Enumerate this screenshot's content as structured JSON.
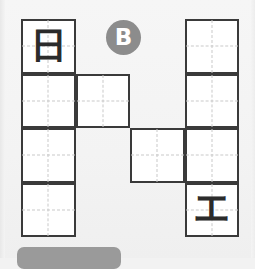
{
  "canvas": {
    "width": 255,
    "height": 258,
    "background": "#f4f4f4"
  },
  "badge": {
    "label": "B",
    "shape": "circle",
    "fill_color": "#8c8c8c",
    "text_color": "#ffffff",
    "x": 106,
    "y": 20,
    "diameter": 35
  },
  "grid": {
    "columns": 4,
    "rows": 4,
    "cell_size": 54.5,
    "origin_x": 21,
    "origin_y": 19,
    "stroke_color": "#3a3a3a",
    "cell_fill": "#ffffff",
    "guide_color": "#c9c9c9",
    "guide_style": "dashed"
  },
  "cells": [
    {
      "row": 1,
      "col": 1,
      "glyph": "日",
      "glyph_name": "kanji-sun-day"
    },
    {
      "row": 1,
      "col": 4,
      "glyph": "",
      "glyph_name": ""
    },
    {
      "row": 2,
      "col": 1,
      "glyph": "",
      "glyph_name": ""
    },
    {
      "row": 2,
      "col": 2,
      "glyph": "",
      "glyph_name": ""
    },
    {
      "row": 2,
      "col": 4,
      "glyph": "",
      "glyph_name": ""
    },
    {
      "row": 3,
      "col": 1,
      "glyph": "",
      "glyph_name": ""
    },
    {
      "row": 3,
      "col": 3,
      "glyph": "",
      "glyph_name": ""
    },
    {
      "row": 3,
      "col": 4,
      "glyph": "",
      "glyph_name": ""
    },
    {
      "row": 4,
      "col": 1,
      "glyph": "",
      "glyph_name": ""
    },
    {
      "row": 4,
      "col": 4,
      "glyph": "エ",
      "glyph_name": "katakana-e"
    }
  ],
  "bottom_bar": {
    "fill_color": "#9a9a9a",
    "x": 17,
    "y": 247,
    "width": 104,
    "height": 22
  }
}
